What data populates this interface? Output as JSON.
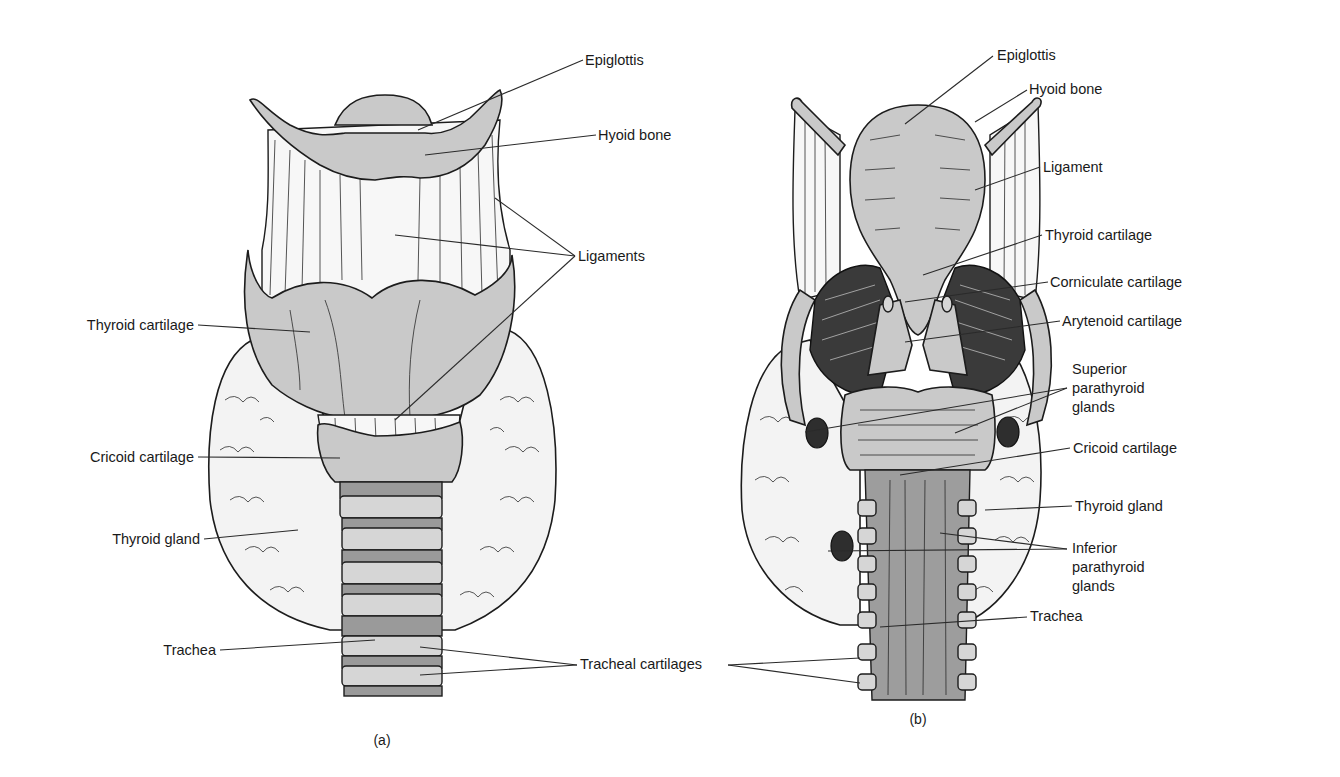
{
  "figure": {
    "panels": [
      {
        "id": "a",
        "caption": "(a)",
        "view": "anterior",
        "labels": [
          {
            "text": "Epiglottis",
            "x": 585,
            "y": 65,
            "anchor": "start",
            "line": [
              [
                583,
                60
              ],
              [
                418,
                130
              ]
            ]
          },
          {
            "text": "Hyoid bone",
            "x": 598,
            "y": 140,
            "anchor": "start",
            "line": [
              [
                596,
                135
              ],
              [
                425,
                155
              ]
            ]
          },
          {
            "text": "Ligaments",
            "x": 578,
            "y": 261,
            "anchor": "start",
            "lines": [
              [
                [
                  575,
                  256
                ],
                [
                  495,
                  198
                ]
              ],
              [
                [
                  575,
                  256
                ],
                [
                  395,
                  235
                ]
              ],
              [
                [
                  575,
                  256
                ],
                [
                  395,
                  420
                ]
              ]
            ]
          },
          {
            "text": "Thyroid cartilage",
            "x": 194,
            "y": 330,
            "anchor": "end",
            "line": [
              [
                198,
                325
              ],
              [
                310,
                332
              ]
            ]
          },
          {
            "text": "Cricoid cartilage",
            "x": 194,
            "y": 462,
            "anchor": "end",
            "line": [
              [
                198,
                457
              ],
              [
                340,
                458
              ]
            ]
          },
          {
            "text": "Thyroid gland",
            "x": 200,
            "y": 544,
            "anchor": "end",
            "line": [
              [
                204,
                539
              ],
              [
                298,
                530
              ]
            ]
          },
          {
            "text": "Trachea",
            "x": 216,
            "y": 655,
            "anchor": "end",
            "line": [
              [
                220,
                650
              ],
              [
                375,
                640
              ]
            ]
          },
          {
            "text": "Tracheal cartilages",
            "x": 580,
            "y": 669,
            "anchor": "start",
            "lines": [
              [
                [
                  577,
                  665
                ],
                [
                  420,
                  647
                ]
              ],
              [
                [
                  577,
                  665
                ],
                [
                  420,
                  675
                ]
              ],
              [
                [
                  728,
                  665
                ],
                [
                  860,
                  658
                ]
              ],
              [
                [
                  728,
                  665
                ],
                [
                  860,
                  683
                ]
              ]
            ]
          }
        ]
      },
      {
        "id": "b",
        "caption": "(b)",
        "view": "posterior",
        "labels": [
          {
            "text": "Epiglottis",
            "x": 997,
            "y": 60,
            "anchor": "start",
            "line": [
              [
                993,
                56
              ],
              [
                905,
                124
              ]
            ]
          },
          {
            "text": "Hyoid bone",
            "x": 1029,
            "y": 94,
            "anchor": "start",
            "line": [
              [
                1027,
                90
              ],
              [
                975,
                122
              ]
            ]
          },
          {
            "text": "Ligament",
            "x": 1043,
            "y": 172,
            "anchor": "start",
            "line": [
              [
                1040,
                167
              ],
              [
                975,
                190
              ]
            ]
          },
          {
            "text": "Thyroid cartilage",
            "x": 1045,
            "y": 240,
            "anchor": "start",
            "line": [
              [
                1042,
                235
              ],
              [
                923,
                275
              ]
            ]
          },
          {
            "text": "Corniculate cartilage",
            "x": 1050,
            "y": 287,
            "anchor": "start",
            "line": [
              [
                1048,
                282
              ],
              [
                905,
                302
              ]
            ]
          },
          {
            "text": "Arytenoid cartilage",
            "x": 1062,
            "y": 326,
            "anchor": "start",
            "line": [
              [
                1060,
                321
              ],
              [
                905,
                342
              ]
            ]
          },
          {
            "text": [
              "Superior",
              "parathyroid",
              "glands"
            ],
            "x": 1072,
            "y": 374,
            "anchor": "start",
            "lines": [
              [
                [
                  1067,
                  388
                ],
                [
                  805,
                  432
                ]
              ],
              [
                [
                  1067,
                  388
                ],
                [
                  955,
                  433
                ]
              ]
            ]
          },
          {
            "text": "Cricoid cartilage",
            "x": 1073,
            "y": 453,
            "anchor": "start",
            "line": [
              [
                1070,
                448
              ],
              [
                900,
                475
              ]
            ]
          },
          {
            "text": "Thyroid gland",
            "x": 1075,
            "y": 511,
            "anchor": "start",
            "line": [
              [
                1072,
                506
              ],
              [
                985,
                510
              ]
            ]
          },
          {
            "text": [
              "Inferior",
              "parathyroid",
              "glands"
            ],
            "x": 1072,
            "y": 553,
            "anchor": "start",
            "lines": [
              [
                [
                  1067,
                  549
                ],
                [
                  940,
                  533
                ]
              ],
              [
                [
                  1067,
                  549
                ],
                [
                  828,
                  551
                ]
              ]
            ]
          },
          {
            "text": "Trachea",
            "x": 1030,
            "y": 621,
            "anchor": "start",
            "line": [
              [
                1027,
                617
              ],
              [
                880,
                627
              ]
            ]
          }
        ]
      }
    ]
  },
  "labels_index": {
    "a": [
      "Epiglottis",
      "Hyoid bone",
      "Ligaments",
      "Thyroid cartilage",
      "Cricoid cartilage",
      "Thyroid gland",
      "Trachea",
      "Tracheal cartilages"
    ],
    "b": [
      "Epiglottis",
      "Hyoid bone",
      "Ligament",
      "Thyroid cartilage",
      "Corniculate cartilage",
      "Arytenoid cartilage",
      "Superior parathyroid glands",
      "Cricoid cartilage",
      "Thyroid gland",
      "Inferior parathyroid glands",
      "Trachea"
    ]
  },
  "captions": {
    "a": "(a)",
    "b": "(b)"
  },
  "colors": {
    "background": "#ffffff",
    "ink": "#1c1c1c",
    "cartilage": "#c9c9c9",
    "dark_tissue": "#3a3a3a"
  }
}
